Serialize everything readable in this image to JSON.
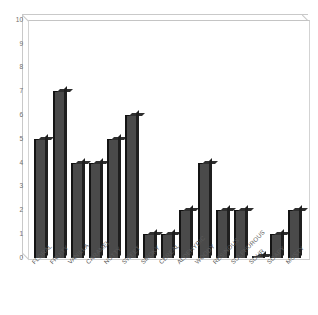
{
  "chart_data": {
    "type": "bar",
    "title": "",
    "subtitle": "",
    "xlabel": "",
    "ylabel": "",
    "ylim": [
      0,
      10
    ],
    "yticks": [
      10,
      9,
      8,
      7,
      6,
      5,
      4,
      3,
      2,
      1,
      0
    ],
    "grid": false,
    "legend": null,
    "categories": [
      "FLORAL",
      "FRUITY",
      "VANILLA",
      "CARAMEL",
      "NUTTY",
      "SWEET",
      "SMOKY",
      "CEREAL",
      "ALDEHYDIC",
      "WOODY",
      "RESINOUS",
      "SULPHUROUS",
      "SOUR",
      "SOAPY",
      "MUSTY"
    ],
    "values": [
      5,
      7,
      4,
      4,
      5,
      6,
      1,
      1,
      2,
      4,
      2,
      2,
      0,
      1,
      2
    ],
    "colors": {
      "bar_face": "#4a4a4a",
      "bar_edge": "#141414",
      "frame": "#d3d3d3",
      "background": "#ffffff",
      "tick_text": "#6e6e6e",
      "label_text": "#5c5c5c"
    }
  }
}
